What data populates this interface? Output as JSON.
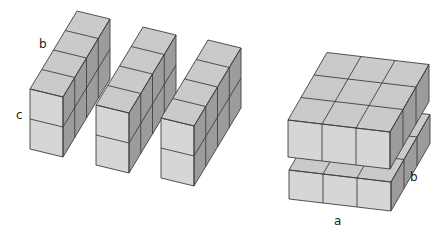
{
  "figure": {
    "colors": {
      "front": "#d6d6d6",
      "top": "#cacaca",
      "side": "#9c9c9c",
      "edge": "#3f3f3f"
    },
    "left_group": {
      "prisms": [
        {
          "name": "prism-1",
          "width": 1,
          "depth": 4,
          "height": 2,
          "origin": [
            30,
            89
          ]
        },
        {
          "name": "prism-2",
          "width": 1,
          "depth": 4,
          "height": 2,
          "origin": [
            96,
            105
          ]
        },
        {
          "name": "prism-3",
          "width": 1,
          "depth": 4,
          "height": 2,
          "origin": [
            161,
            118
          ]
        }
      ],
      "vectors": {
        "w": [
          33,
          8
        ],
        "h": [
          0,
          30
        ],
        "d": [
          11.75,
          -19.5
        ]
      },
      "labels": [
        {
          "text": "b",
          "x": 39,
          "y": 48
        },
        {
          "text": "c",
          "x": 16,
          "y": 119
        }
      ]
    },
    "right_group": {
      "slabs": [
        {
          "name": "upper-slab",
          "width": 3,
          "depth": 3,
          "height": 1,
          "origin": [
            288,
            120
          ],
          "h": [
            0,
            37
          ]
        },
        {
          "name": "lower-slab",
          "width": 3,
          "depth": 3,
          "height": 1,
          "origin": [
            289,
            170
          ],
          "h": [
            0,
            29
          ]
        }
      ],
      "vectors": {
        "w": [
          34,
          4
        ],
        "d": [
          13,
          -22.5
        ]
      },
      "labels": [
        {
          "text": "a",
          "x": 334,
          "y": 225
        },
        {
          "text": "b",
          "x": 410,
          "y": 181
        }
      ]
    }
  }
}
